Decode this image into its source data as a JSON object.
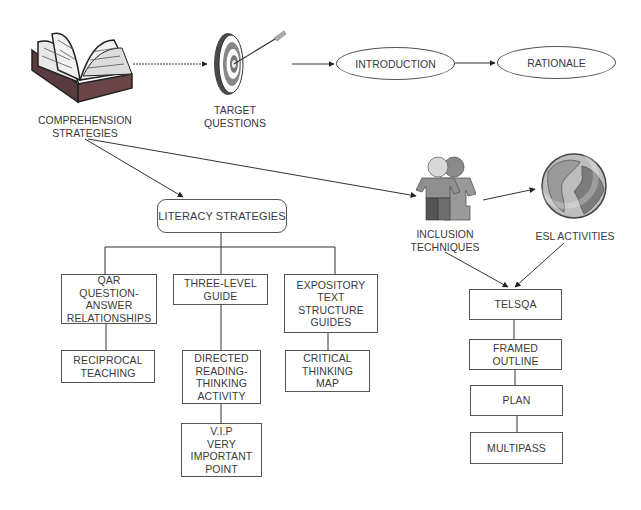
{
  "diagram": {
    "top_row": {
      "comprehension": {
        "label": "COMPREHENSION\nSTRATEGIES",
        "icon": "open-book-icon"
      },
      "target": {
        "label": "TARGET\nQUESTIONS",
        "icon": "target-dartboard-icon"
      },
      "introduction": {
        "label": "INTRODUCTION"
      },
      "rationale": {
        "label": "RATIONALE"
      }
    },
    "literacy": {
      "title": "LITERACY STRATEGIES",
      "columns": [
        {
          "items": [
            "QAR\nQUESTION-\nANSWER\nRELATIONSHIPS",
            "RECIPROCAL\nTEACHING"
          ]
        },
        {
          "items": [
            "THREE-LEVEL\nGUIDE",
            "DIRECTED\nREADING-\nTHINKING\nACTIVITY",
            "V.I.P\nVERY\nIMPORTANT\nPOINT"
          ]
        },
        {
          "items": [
            "EXPOSITORY\nTEXT\nSTRUCTURE\nGUIDES",
            "CRITICAL\nTHINKING\nMAP"
          ]
        }
      ]
    },
    "inclusion": {
      "label": "INCLUSION\nTECHNIQUES",
      "icon": "two-people-icon"
    },
    "esl": {
      "label": "ESL ACTIVITIES",
      "icon": "globe-icon"
    },
    "right_chain": {
      "items": [
        "TELSQA",
        "FRAMED\nOUTLINE",
        "PLAN",
        "MULTIPASS"
      ]
    }
  }
}
